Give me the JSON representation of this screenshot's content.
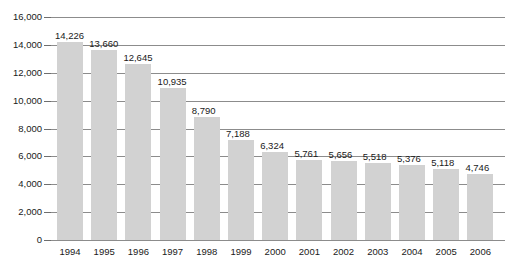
{
  "chart_data": {
    "type": "bar",
    "title": "",
    "subtitle": "",
    "xlabel": "",
    "ylabel": "",
    "categories": [
      "1994",
      "1995",
      "1996",
      "1997",
      "1998",
      "1999",
      "2000",
      "2001",
      "2002",
      "2003",
      "2004",
      "2005",
      "2006"
    ],
    "values": [
      14226,
      13660,
      12645,
      10935,
      8790,
      7188,
      6324,
      5761,
      5656,
      5518,
      5376,
      5118,
      4746
    ],
    "value_labels": [
      "14,226",
      "13,660",
      "12,645",
      "10,935",
      "8,790",
      "7,188",
      "6,324",
      "5,761",
      "5,656",
      "5,518",
      "5,376",
      "5,118",
      "4,746"
    ],
    "ylim": [
      0,
      16000
    ],
    "ytick_values": [
      0,
      2000,
      4000,
      6000,
      8000,
      10000,
      12000,
      14000,
      16000
    ],
    "ytick_labels": [
      "0",
      "2,000",
      "4,000",
      "6,000",
      "8,000",
      "10,000",
      "12,000",
      "14,000",
      "16,000"
    ],
    "grid": true,
    "legend": false,
    "legend_position": "none",
    "bar_color": "#d2d2d2",
    "gridline_color": "#8c8c8c",
    "text_color": "#1a1a1a"
  }
}
